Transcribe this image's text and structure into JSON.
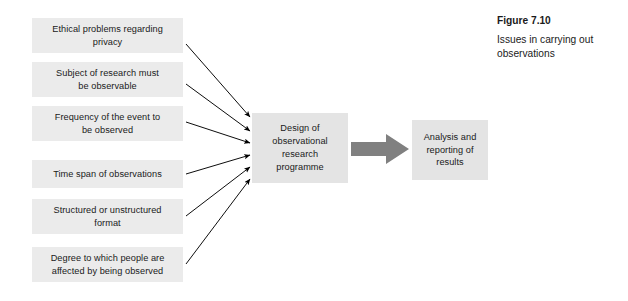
{
  "caption": {
    "figure_number": "Figure 7.10",
    "title": "Issues in carrying out observations"
  },
  "diagram": {
    "factors": [
      {
        "label": "Ethical problems regarding\nprivacy"
      },
      {
        "label": "Subject of research must\nbe observable"
      },
      {
        "label": "Frequency of the event to\nbe observed"
      },
      {
        "label": "Time span of observations"
      },
      {
        "label": "Structured or unstructured\nformat"
      },
      {
        "label": "Degree to which people are\naffected by being observed"
      }
    ],
    "center": {
      "label": "Design of\nobservational\nresearch\nprogramme"
    },
    "outcome": {
      "label": "Analysis and\nreporting of\nresults"
    }
  },
  "colors": {
    "box_fill": "#e8e8e8",
    "arrow_thin": "#000000",
    "arrow_thick": "#808080",
    "text": "#1a1a1a",
    "background": "#ffffff"
  }
}
